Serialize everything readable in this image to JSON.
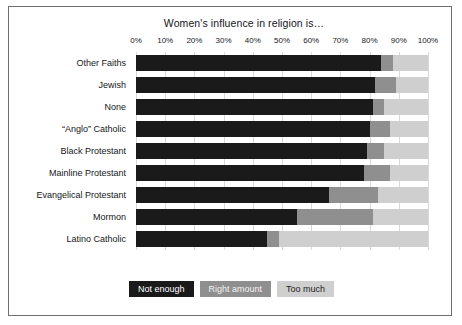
{
  "chart_data": {
    "type": "bar",
    "subtype": "horizontal-stacked-100",
    "title": "Women's influence in religion is…",
    "xlabel": "",
    "ylabel": "",
    "xlim": [
      0,
      100
    ],
    "xticks": [
      "0%",
      "10%",
      "20%",
      "30%",
      "40%",
      "50%",
      "60%",
      "70%",
      "80%",
      "90%",
      "100%"
    ],
    "xtick_values": [
      0,
      10,
      20,
      30,
      40,
      50,
      60,
      70,
      80,
      90,
      100
    ],
    "grid": "vertical",
    "legend_position": "bottom",
    "categories": [
      "Other Faiths",
      "Jewish",
      "None",
      "“Anglo” Catholic",
      "Black Protestant",
      "Mainline Protestant",
      "Evangelical Protestant",
      "Mormon",
      "Latino Catholic"
    ],
    "series": [
      {
        "name": "Not enough",
        "color": "#1a1a1a",
        "values": [
          84,
          82,
          81,
          80,
          79,
          78,
          66,
          55,
          45
        ]
      },
      {
        "name": "Right amount",
        "color": "#8f8f8f",
        "values": [
          4,
          7,
          4,
          7,
          6,
          9,
          17,
          26,
          4
        ]
      },
      {
        "name": "Too much",
        "color": "#cfcfcf",
        "values": [
          12,
          11,
          15,
          13,
          15,
          13,
          17,
          19,
          51
        ]
      }
    ]
  },
  "legend": {
    "items": [
      {
        "label": "Not enough"
      },
      {
        "label": "Right amount"
      },
      {
        "label": "Too much"
      }
    ]
  }
}
